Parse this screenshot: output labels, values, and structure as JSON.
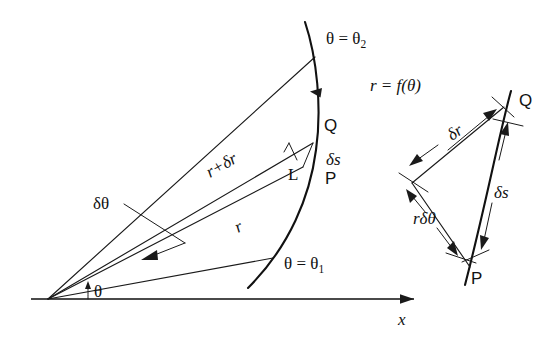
{
  "figure": {
    "colors": {
      "ink": "#1a1a1a",
      "curve": "#111111",
      "axis": "#4a4a4a",
      "background": "#ffffff"
    },
    "main": {
      "origin_label": "θ",
      "axis_label": "x",
      "ray_upper_label": "θ = θ",
      "ray_upper_sub": "2",
      "ray_lower_label": "θ = θ",
      "ray_lower_sub": "1",
      "curve_label": "r = f(θ)",
      "radius_inner_label": "r",
      "radius_outer_label": "r+δr",
      "delta_theta_label": "δθ",
      "delta_s_label": "δs",
      "right_angle_label": "L",
      "point_p_label": "P",
      "point_q_label": "Q"
    },
    "inset": {
      "delta_r_label": "δr",
      "r_delta_theta_label": "rδθ",
      "delta_s_label": "δs",
      "point_p_label": "P",
      "point_q_label": "Q"
    }
  }
}
